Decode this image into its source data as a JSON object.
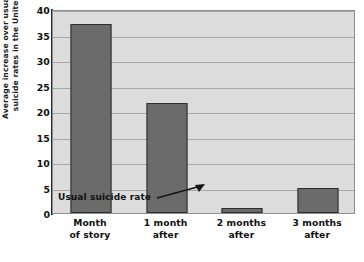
{
  "chart_data": {
    "type": "bar",
    "title": "",
    "xlabel": "",
    "ylabel": "Average increase over usual monthly suicide rates in the United States",
    "ylabel_lines": [
      "Average increase over usual monthly",
      "suicide rates in the United States"
    ],
    "categories": [
      "Month of story",
      "1 month after",
      "2 months after",
      "3 months after"
    ],
    "category_lines": [
      [
        "Month",
        "of story"
      ],
      [
        "1 month",
        "after"
      ],
      [
        "2 months",
        "after"
      ],
      [
        "3 months",
        "after"
      ]
    ],
    "values": [
      37,
      21.5,
      1,
      5
    ],
    "ylim": [
      0,
      40
    ],
    "yticks": [
      40,
      35,
      30,
      25,
      20,
      15,
      10,
      5,
      0
    ],
    "grid": true,
    "legend": "none",
    "annotations": [
      {
        "text": "Usual suicide rate",
        "points_to": "zero reference line at y = 0"
      }
    ],
    "reference_line": {
      "value": 0,
      "label": "Usual suicide rate",
      "style": "dashed"
    },
    "colors": {
      "bar_fill": "#6b6b6b",
      "bar_edge": "#2e2e2e",
      "plot_background": "#dcdcdc",
      "gridline": "#a8a8a8",
      "axis": "#2a2a2a",
      "text": "#111111"
    }
  },
  "caption": ""
}
